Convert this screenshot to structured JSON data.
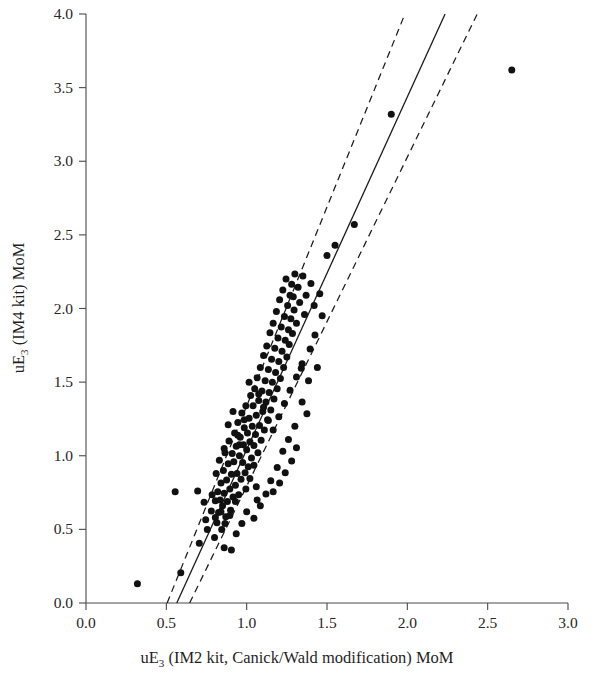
{
  "chart_data": {
    "type": "scatter",
    "title": "",
    "xlabel": "uE3 (IM2 kit, Canick/Wald modification) MoM",
    "xlabel_main_a": "uE",
    "xlabel_sub": "3",
    "xlabel_main_b": " (IM2 kit, Canick/Wald modification) MoM",
    "ylabel": "uE3 (IM4 kit) MoM",
    "ylabel_main_a": "uE",
    "ylabel_sub": "3",
    "ylabel_main_b": " (IM4 kit) MoM",
    "xlim": [
      0.0,
      3.0
    ],
    "ylim": [
      0.0,
      4.0
    ],
    "xticks": [
      "0.0",
      "0.5",
      "1.0",
      "1.5",
      "2.0",
      "2.5",
      "3.0"
    ],
    "yticks": [
      "0.0",
      "0.5",
      "1.0",
      "1.5",
      "2.0",
      "2.5",
      "3.0",
      "3.5",
      "4.0"
    ],
    "xtick_values": [
      0.0,
      0.5,
      1.0,
      1.5,
      2.0,
      2.5,
      3.0
    ],
    "ytick_values": [
      0.0,
      0.5,
      1.0,
      1.5,
      2.0,
      2.5,
      3.0,
      3.5,
      4.0
    ],
    "grid": false,
    "legend": "none",
    "marker_color": "#111111",
    "marker_size_px": 5.2,
    "fit_line": {
      "name": "regression line",
      "style": "solid",
      "color": "#1a1a1a",
      "x_at_y0": 0.565,
      "points": [
        [
          0.565,
          0.0
        ],
        [
          2.235,
          4.0
        ]
      ]
    },
    "confidence_bands": [
      {
        "name": "lower confidence band",
        "style": "dashed",
        "color": "#1a1a1a",
        "points": [
          [
            0.505,
            0.0
          ],
          [
            1.985,
            4.0
          ]
        ]
      },
      {
        "name": "upper confidence band",
        "style": "dashed",
        "color": "#1a1a1a",
        "points": [
          [
            0.645,
            0.0
          ],
          [
            2.435,
            4.0
          ]
        ]
      }
    ],
    "points": [
      [
        0.32,
        0.13
      ],
      [
        0.555,
        0.755
      ],
      [
        0.705,
        0.405
      ],
      [
        0.745,
        0.565
      ],
      [
        0.755,
        0.5
      ],
      [
        0.78,
        0.625
      ],
      [
        0.8,
        0.445
      ],
      [
        0.805,
        0.695
      ],
      [
        0.81,
        0.88
      ],
      [
        0.815,
        0.545
      ],
      [
        0.82,
        0.755
      ],
      [
        0.825,
        0.615
      ],
      [
        0.83,
        0.97
      ],
      [
        0.835,
        0.7
      ],
      [
        0.84,
        0.815
      ],
      [
        0.845,
        0.5
      ],
      [
        0.85,
        0.66
      ],
      [
        0.855,
        0.9
      ],
      [
        0.86,
        0.745
      ],
      [
        0.865,
        1.02
      ],
      [
        0.87,
        0.585
      ],
      [
        0.875,
        0.835
      ],
      [
        0.88,
        0.69
      ],
      [
        0.885,
        0.945
      ],
      [
        0.89,
        1.1
      ],
      [
        0.895,
        0.775
      ],
      [
        0.9,
        0.63
      ],
      [
        0.905,
        0.875
      ],
      [
        0.91,
        1.015
      ],
      [
        0.915,
        0.72
      ],
      [
        0.92,
        0.96
      ],
      [
        0.925,
        1.155
      ],
      [
        0.93,
        0.8
      ],
      [
        0.935,
        1.065
      ],
      [
        0.94,
        0.88
      ],
      [
        0.945,
        1.225
      ],
      [
        0.95,
        0.735
      ],
      [
        0.955,
        1.0
      ],
      [
        0.96,
        1.125
      ],
      [
        0.965,
        0.84
      ],
      [
        0.97,
        1.29
      ],
      [
        0.975,
        0.955
      ],
      [
        0.98,
        1.075
      ],
      [
        0.985,
        1.19
      ],
      [
        0.99,
        0.885
      ],
      [
        0.995,
        1.34
      ],
      [
        1.0,
        1.04
      ],
      [
        1.005,
        1.155
      ],
      [
        1.01,
        0.925
      ],
      [
        1.015,
        1.255
      ],
      [
        1.02,
        1.095
      ],
      [
        1.025,
        1.41
      ],
      [
        1.03,
        0.985
      ],
      [
        1.035,
        1.2
      ],
      [
        1.04,
        1.34
      ],
      [
        1.045,
        1.07
      ],
      [
        1.05,
        1.455
      ],
      [
        1.055,
        1.145
      ],
      [
        1.06,
        1.275
      ],
      [
        1.065,
        1.53
      ],
      [
        1.07,
        1.02
      ],
      [
        1.075,
        1.375
      ],
      [
        1.08,
        1.205
      ],
      [
        1.085,
        1.6
      ],
      [
        1.09,
        1.105
      ],
      [
        1.095,
        1.44
      ],
      [
        1.1,
        1.3
      ],
      [
        1.105,
        1.68
      ],
      [
        1.11,
        1.175
      ],
      [
        1.115,
        1.51
      ],
      [
        1.12,
        1.365
      ],
      [
        1.125,
        1.745
      ],
      [
        1.13,
        1.245
      ],
      [
        1.135,
        1.585
      ],
      [
        1.14,
        1.43
      ],
      [
        1.145,
        1.835
      ],
      [
        1.15,
        1.31
      ],
      [
        1.155,
        1.655
      ],
      [
        1.16,
        1.5
      ],
      [
        1.165,
        1.9
      ],
      [
        1.17,
        1.385
      ],
      [
        1.175,
        1.73
      ],
      [
        1.18,
        1.565
      ],
      [
        1.185,
        1.98
      ],
      [
        1.19,
        1.455
      ],
      [
        1.195,
        1.8
      ],
      [
        1.2,
        1.64
      ],
      [
        1.205,
        2.06
      ],
      [
        1.21,
        1.525
      ],
      [
        1.215,
        1.875
      ],
      [
        1.22,
        1.71
      ],
      [
        1.225,
        2.125
      ],
      [
        1.23,
        1.6
      ],
      [
        1.235,
        1.945
      ],
      [
        1.24,
        1.785
      ],
      [
        1.245,
        2.2
      ],
      [
        1.25,
        1.67
      ],
      [
        1.255,
        2.02
      ],
      [
        1.26,
        1.855
      ],
      [
        1.265,
        1.755
      ],
      [
        1.27,
        2.09
      ],
      [
        1.275,
        1.93
      ],
      [
        1.28,
        2.165
      ],
      [
        1.285,
        1.83
      ],
      [
        1.29,
        2.08
      ],
      [
        1.295,
        1.99
      ],
      [
        1.3,
        2.235
      ],
      [
        1.31,
        1.9
      ],
      [
        1.32,
        2.145
      ],
      [
        1.33,
        2.04
      ],
      [
        1.34,
        1.595
      ],
      [
        1.35,
        2.22
      ],
      [
        1.36,
        1.96
      ],
      [
        1.37,
        2.09
      ],
      [
        1.385,
        1.51
      ],
      [
        1.4,
        2.17
      ],
      [
        1.42,
        2.02
      ],
      [
        1.44,
        1.6
      ],
      [
        1.455,
        2.1
      ],
      [
        1.47,
        1.95
      ],
      [
        1.5,
        2.36
      ],
      [
        1.55,
        2.43
      ],
      [
        1.67,
        2.57
      ],
      [
        1.9,
        3.32
      ],
      [
        2.65,
        3.62
      ],
      [
        0.59,
        0.205
      ],
      [
        0.86,
        0.375
      ],
      [
        0.905,
        0.36
      ],
      [
        0.935,
        0.47
      ],
      [
        0.97,
        0.54
      ],
      [
        1.0,
        0.62
      ],
      [
        1.045,
        0.575
      ],
      [
        1.085,
        0.66
      ],
      [
        1.12,
        0.74
      ],
      [
        1.15,
        0.83
      ],
      [
        1.06,
        0.79
      ],
      [
        0.93,
        0.69
      ],
      [
        0.895,
        0.595
      ],
      [
        0.865,
        0.54
      ],
      [
        0.84,
        0.62
      ],
      [
        0.805,
        0.58
      ],
      [
        0.785,
        0.735
      ],
      [
        0.735,
        0.685
      ],
      [
        0.695,
        0.76
      ],
      [
        1.19,
        0.92
      ],
      [
        1.225,
        1.03
      ],
      [
        1.26,
        1.11
      ],
      [
        1.3,
        1.2
      ],
      [
        1.28,
        0.965
      ],
      [
        1.24,
        0.885
      ],
      [
        1.205,
        0.815
      ],
      [
        1.165,
        0.755
      ],
      [
        1.135,
        1.24
      ],
      [
        1.105,
        1.33
      ],
      [
        1.075,
        1.42
      ],
      [
        1.165,
        1.175
      ],
      [
        1.2,
        1.265
      ],
      [
        1.235,
        1.355
      ],
      [
        1.27,
        1.445
      ],
      [
        1.31,
        1.535
      ],
      [
        1.345,
        1.625
      ],
      [
        0.995,
        0.775
      ],
      [
        1.02,
        0.845
      ],
      [
        1.045,
        0.935
      ],
      [
        1.065,
        0.7
      ],
      [
        0.955,
        1.075
      ],
      [
        0.985,
        1.245
      ],
      [
        1.015,
        1.5
      ],
      [
        0.945,
        1.14
      ],
      [
        0.915,
        1.3
      ],
      [
        0.885,
        1.21
      ],
      [
        0.86,
        1.05
      ],
      [
        1.395,
        1.725
      ],
      [
        1.425,
        1.82
      ],
      [
        1.345,
        1.365
      ],
      [
        1.31,
        1.055
      ],
      [
        1.375,
        1.285
      ]
    ],
    "n_points": 175
  }
}
